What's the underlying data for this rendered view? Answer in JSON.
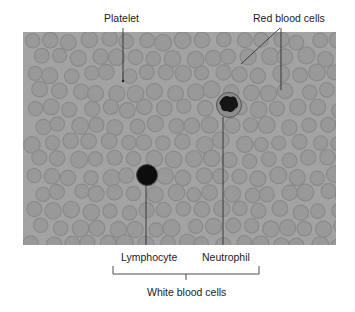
{
  "figure": {
    "type": "labeled blood smear micrograph",
    "labels": {
      "platelet": "Platelet",
      "red_blood_cells": "Red blood cells",
      "lymphocyte": "Lymphocyte",
      "neutrophil": "Neutrophil",
      "white_blood_cells": "White blood cells"
    },
    "colors": {
      "background": "#ffffff",
      "smear": "#a3a3a3",
      "rbc_fill": "#9a9a9a",
      "rbc_edge": "#8a8a8a",
      "nucleus": "#111111",
      "leader_line": "#222222"
    }
  }
}
